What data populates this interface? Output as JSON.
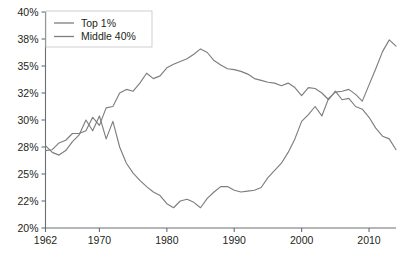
{
  "chart_data": {
    "type": "line",
    "title": "",
    "subtitle": "",
    "xlabel": "",
    "ylabel": "",
    "grid": false,
    "legend_position": "top-left",
    "x": [
      1962,
      1963,
      1964,
      1965,
      1966,
      1967,
      1968,
      1969,
      1970,
      1971,
      1972,
      1973,
      1974,
      1975,
      1976,
      1977,
      1978,
      1979,
      1980,
      1981,
      1982,
      1983,
      1984,
      1985,
      1986,
      1987,
      1988,
      1989,
      1990,
      1991,
      1992,
      1993,
      1994,
      1995,
      1996,
      1997,
      1998,
      1999,
      2000,
      2001,
      2002,
      2003,
      2004,
      2005,
      2006,
      2007,
      2008,
      2009,
      2010,
      2011,
      2012,
      2013,
      2014
    ],
    "xlim": [
      1962,
      2014
    ],
    "ylim": [
      20,
      40
    ],
    "ytick_labels": [
      "20%",
      "22%",
      "25%",
      "28%",
      "30%",
      "32%",
      "35%",
      "38%",
      "40%"
    ],
    "ytick_values": [
      20,
      22,
      25,
      28,
      30,
      32,
      35,
      38,
      40
    ],
    "xtick_labels": [
      "1962",
      "1970",
      "1980",
      "1990",
      "2000",
      "2010"
    ],
    "xtick_values": [
      1962,
      1970,
      1980,
      1990,
      2000,
      2010
    ],
    "series": [
      {
        "name": "Top 1%",
        "color": "#7d7e80",
        "values": [
          28.1,
          27.4,
          27.1,
          27.6,
          28.4,
          28.9,
          30.0,
          29.2,
          30.3,
          28.6,
          29.9,
          28.0,
          26.2,
          25.1,
          24.3,
          23.6,
          23.0,
          22.6,
          21.8,
          21.5,
          22.0,
          22.2,
          21.9,
          21.5,
          22.3,
          23.0,
          23.6,
          23.6,
          23.2,
          23.0,
          23.1,
          23.2,
          23.5,
          24.6,
          25.4,
          26.2,
          27.4,
          28.6,
          29.9,
          30.4,
          31.0,
          30.3,
          31.6,
          32.1,
          32.2,
          32.4,
          31.9,
          31.4,
          32.9,
          34.7,
          36.6,
          37.9,
          37.2
        ]
      },
      {
        "name": "Middle 40%",
        "color": "#7d7e80",
        "values": [
          27.6,
          27.7,
          28.3,
          28.5,
          29.0,
          29.0,
          29.2,
          30.2,
          29.6,
          30.9,
          31.0,
          32.0,
          32.4,
          32.2,
          33.1,
          34.2,
          33.6,
          33.9,
          34.8,
          35.2,
          35.5,
          35.8,
          36.3,
          36.9,
          36.5,
          35.6,
          35.1,
          34.7,
          34.6,
          34.4,
          34.1,
          33.6,
          33.4,
          33.2,
          33.1,
          32.8,
          33.1,
          32.6,
          31.8,
          32.6,
          32.5,
          32.0,
          31.5,
          32.2,
          31.5,
          31.6,
          31.0,
          30.8,
          30.2,
          29.4,
          28.8,
          28.6,
          27.7
        ]
      }
    ]
  },
  "legend": {
    "items": [
      {
        "label": "Top 1%"
      },
      {
        "label": "Middle 40%"
      }
    ]
  }
}
